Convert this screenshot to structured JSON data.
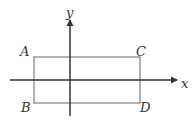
{
  "diagram": {
    "axes": {
      "x_label": "x",
      "y_label": "y"
    },
    "rectangle": {
      "vertices": [
        {
          "name": "A",
          "position": "top-left"
        },
        {
          "name": "C",
          "position": "top-right"
        },
        {
          "name": "B",
          "position": "bottom-left"
        },
        {
          "name": "D",
          "position": "bottom-right"
        }
      ]
    },
    "colors": {
      "line": "#555555",
      "axis": "#333333"
    }
  }
}
